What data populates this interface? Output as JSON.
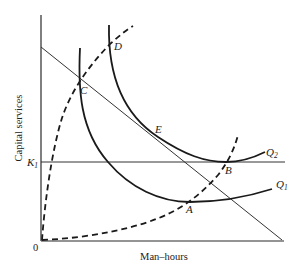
{
  "diagram": {
    "type": "isoquant-expansion-path",
    "axes": {
      "x_label": "Man–hours",
      "y_label": "Capital services",
      "origin_label": "0",
      "k1_label_main": "K",
      "k1_label_sub": "1"
    },
    "points": {
      "A": "A",
      "B": "B",
      "C": "C",
      "D": "D",
      "E": "E"
    },
    "curves": {
      "q1_main": "Q",
      "q1_sub": "1",
      "q2_main": "Q",
      "q2_sub": "2"
    },
    "lines": [
      {
        "name": "budget-line",
        "from": [
          41,
          47
        ],
        "to": [
          282,
          240
        ]
      },
      {
        "name": "k1-line",
        "from": [
          41,
          162
        ],
        "to": [
          285,
          162
        ]
      }
    ],
    "colors": {
      "ink": "#1a1a1a",
      "background": "#ffffff"
    }
  }
}
